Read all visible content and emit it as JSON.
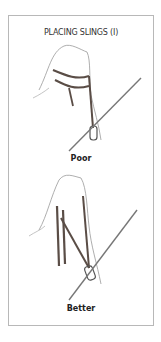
{
  "title": "PLACING SLINGS (I)",
  "figures": [
    {
      "caption": "Poor",
      "icon": "hand-with-sling-poor"
    },
    {
      "caption": "Better",
      "icon": "hand-with-sling-better"
    }
  ],
  "colors": {
    "frame": "#b8b8b8",
    "sling": "#5a4d46",
    "line": "#777777"
  }
}
